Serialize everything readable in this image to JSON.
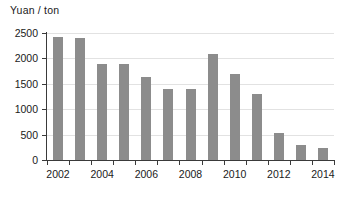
{
  "chart_data": {
    "type": "bar",
    "title": "Yuan / ton",
    "subtitle": "",
    "xlabel": "",
    "ylabel": "Yuan / ton",
    "ylim": [
      0,
      2500
    ],
    "y_ticks": [
      0,
      500,
      1000,
      1500,
      2000,
      2500
    ],
    "y_tick_labels": [
      "0",
      "500",
      "1000",
      "1500",
      "2000",
      "2500"
    ],
    "grid": true,
    "legend": false,
    "legend_position": "none",
    "x_tick_labels": [
      "2002",
      "2004",
      "2006",
      "2008",
      "2010",
      "2012",
      "2014"
    ],
    "categories": [
      "2002",
      "2003",
      "2004",
      "2005",
      "2006",
      "2007",
      "2008",
      "2009",
      "2010",
      "2011",
      "2012",
      "2013",
      "2014"
    ],
    "values": [
      2430,
      2400,
      1890,
      1890,
      1640,
      1390,
      1390,
      2080,
      1690,
      1290,
      530,
      300,
      230
    ],
    "bar_color": "#8c8c8c",
    "grid_color": "#e2e2e2",
    "axis_color": "#3a3a3a"
  },
  "axis_title": "Yuan / ton"
}
